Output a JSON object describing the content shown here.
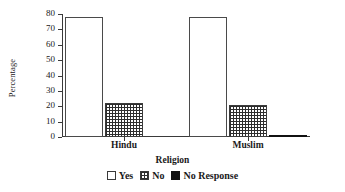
{
  "chart_data": {
    "type": "bar",
    "title": "",
    "xlabel": "Religion",
    "ylabel": "Percentage",
    "categories": [
      "Hindu",
      "Muslim"
    ],
    "series": [
      {
        "name": "Yes",
        "values": [
          78,
          78
        ],
        "fill": "white",
        "color": "#ffffff"
      },
      {
        "name": "No",
        "values": [
          22,
          21
        ],
        "fill": "cross-hatch",
        "color": "#2e2e2e"
      },
      {
        "name": "No Response",
        "values": [
          0,
          1
        ],
        "fill": "solid-black",
        "color": "#111111"
      }
    ],
    "ylim": [
      0,
      80
    ],
    "yticks": [
      0,
      10,
      20,
      30,
      40,
      50,
      60,
      70,
      80
    ],
    "ytick_labels": [
      "0",
      "10",
      "20",
      "30",
      "40",
      "50",
      "60",
      "70",
      "80"
    ],
    "grid": false,
    "legend_position": "bottom"
  },
  "axes": {
    "y_title": "Percentage",
    "x_title": "Religion"
  },
  "legend": {
    "items": [
      {
        "label": "Yes",
        "swatch": "empty-square-icon"
      },
      {
        "label": "No",
        "swatch": "hatched-square-icon"
      },
      {
        "label": "No Response",
        "swatch": "filled-square-icon"
      }
    ]
  }
}
